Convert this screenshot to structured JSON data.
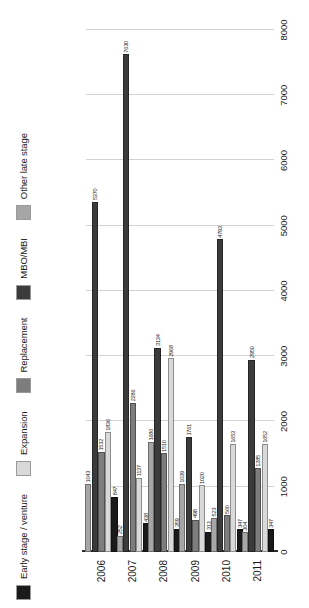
{
  "chart_data": {
    "type": "bar",
    "orientation": "horizontal",
    "title": "",
    "xlabel": "",
    "ylabel": "",
    "xlim": [
      0,
      8000
    ],
    "xticks": [
      "0",
      "1000",
      "2000",
      "3000",
      "4000",
      "5000",
      "6000",
      "7000",
      "8000"
    ],
    "xtick_values": [
      0,
      1000,
      2000,
      3000,
      4000,
      5000,
      6000,
      7000,
      8000
    ],
    "grid": true,
    "legend_position": "top-left",
    "categories": [
      "2006",
      "2007",
      "2008",
      "2009",
      "2010",
      "2011"
    ],
    "series": [
      {
        "name": "Early stage / venture",
        "color": "#1a1a1a",
        "values": [
          847,
          438,
          359,
          313,
          347,
          347
        ]
      },
      {
        "name": "Expansion",
        "color": "#d9d9d9",
        "values": [
          1836,
          1137,
          2968,
          1020,
          1653,
          1652
        ]
      },
      {
        "name": "Replacement",
        "color": "#7d7d7d",
        "values": [
          1532,
          2286,
          1510,
          498,
          560,
          1285
        ]
      },
      {
        "name": "MBO/MBI",
        "color": "#3b3b3b",
        "values": [
          5370,
          7630,
          3134,
          1761,
          4793,
          2950
        ]
      },
      {
        "name": "Other late stage",
        "color": "#a6a6a6",
        "values": [
          1043,
          252,
          1686,
          1039,
          523,
          304
        ]
      }
    ]
  },
  "legend": {
    "items": [
      {
        "label": "Early stage / venture",
        "color": "#1a1a1a"
      },
      {
        "label": "Expansion",
        "color": "#d9d9d9"
      },
      {
        "label": "Replacement",
        "color": "#7d7d7d"
      },
      {
        "label": "MBO/MBI",
        "color": "#3b3b3b"
      },
      {
        "label": "Other late stage",
        "color": "#a6a6a6"
      }
    ]
  }
}
